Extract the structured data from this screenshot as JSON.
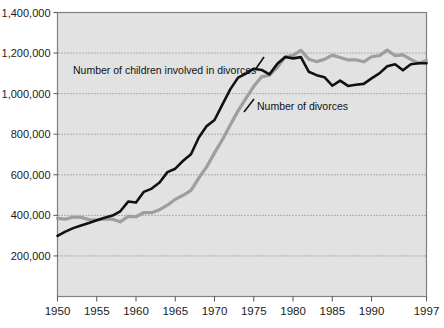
{
  "chart_data": {
    "type": "line",
    "title": "",
    "subtitle": "",
    "xlabel": "",
    "ylabel": "",
    "xlim": [
      1950,
      1997
    ],
    "ylim": [
      0,
      1400000
    ],
    "grid": true,
    "grid_axis": "y",
    "legend_position": "inline-annotations",
    "background_color": "#e2e2e2",
    "plot_border_color": "#808080",
    "x_tick_labels": [
      "1950",
      "1955",
      "1960",
      "1965",
      "1970",
      "1975",
      "1980",
      "1985",
      "1990",
      "1997"
    ],
    "x_tick_values": [
      1950,
      1955,
      1960,
      1965,
      1970,
      1975,
      1980,
      1985,
      1990,
      1997
    ],
    "y_tick_labels": [
      "1,400,000",
      "1,200,000",
      "1,000,000",
      "800,000",
      "600,000",
      "400,000",
      "200,000"
    ],
    "y_tick_values": [
      1400000,
      1200000,
      1000000,
      800000,
      600000,
      400000,
      200000
    ],
    "x": [
      1950,
      1951,
      1952,
      1953,
      1954,
      1955,
      1956,
      1957,
      1958,
      1959,
      1960,
      1961,
      1962,
      1963,
      1964,
      1965,
      1966,
      1967,
      1968,
      1969,
      1970,
      1971,
      1972,
      1973,
      1974,
      1975,
      1976,
      1977,
      1978,
      1979,
      1980,
      1981,
      1982,
      1983,
      1984,
      1985,
      1986,
      1987,
      1988,
      1989,
      1990,
      1991,
      1992,
      1993,
      1994,
      1995,
      1996,
      1997
    ],
    "series": [
      {
        "name": "Number of children involved in divorces",
        "color": "#111111",
        "line_width": 2.6,
        "annotation_text": "Number of children involved in divorces",
        "values": [
          299000,
          320000,
          337000,
          350000,
          362000,
          376000,
          388000,
          399000,
          420000,
          468000,
          463000,
          516000,
          532000,
          562000,
          613000,
          630000,
          669000,
          701000,
          784000,
          840000,
          870000,
          946000,
          1021000,
          1079000,
          1099000,
          1123000,
          1117000,
          1095000,
          1147000,
          1181000,
          1174000,
          1180000,
          1108000,
          1091000,
          1081000,
          1039000,
          1064000,
          1038000,
          1044000,
          1048000,
          1075000,
          1100000,
          1135000,
          1145000,
          1115000,
          1145000,
          1150000,
          1150000
        ]
      },
      {
        "name": "Number of divorces",
        "color": "#9e9e9e",
        "line_width": 3.2,
        "annotation_text": "Number of divorces",
        "values": [
          385000,
          381000,
          392000,
          390000,
          379000,
          377000,
          382000,
          381000,
          368000,
          395000,
          393000,
          414000,
          413000,
          428000,
          450000,
          479000,
          499000,
          523000,
          584000,
          639000,
          708000,
          773000,
          845000,
          915000,
          977000,
          1036000,
          1083000,
          1091000,
          1130000,
          1181000,
          1189000,
          1213000,
          1170000,
          1158000,
          1169000,
          1190000,
          1178000,
          1166000,
          1167000,
          1157000,
          1182000,
          1187000,
          1215000,
          1187000,
          1191000,
          1169000,
          1150000,
          1163000
        ]
      }
    ],
    "annotations": [
      {
        "text": "Number of children involved in divorces",
        "x_px": 73,
        "y_px": 74,
        "leader_from_px": [
          255,
          70
        ],
        "leader_to_px": [
          264,
          57
        ]
      },
      {
        "text": "Number of divorces",
        "x_px": 257,
        "y_px": 110,
        "leader_from_px": [
          244,
          112
        ],
        "leader_to_px": [
          254,
          99
        ]
      }
    ]
  }
}
